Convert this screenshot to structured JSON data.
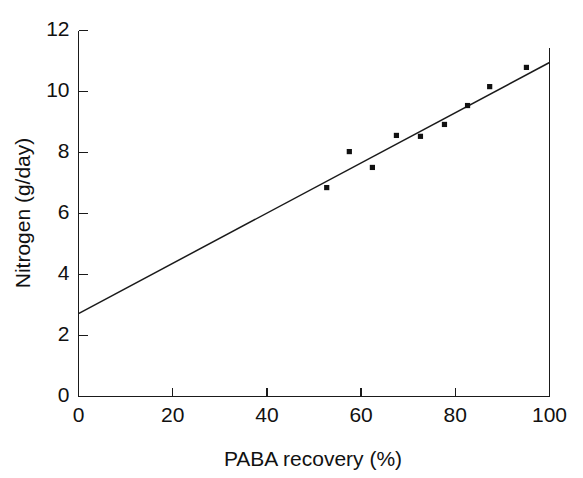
{
  "chart_data": {
    "type": "scatter",
    "title": "",
    "subtitle": "",
    "xlabel": "PABA recovery (%)",
    "ylabel": "Nitrogen (g/day)",
    "xlim": [
      0,
      100
    ],
    "ylim": [
      0,
      12
    ],
    "xticks": [
      0,
      20,
      40,
      60,
      80,
      100
    ],
    "yticks": [
      0,
      2,
      4,
      6,
      8,
      10,
      12
    ],
    "xtick_labels": [
      "0",
      "20",
      "40",
      "60",
      "80",
      "100"
    ],
    "ytick_labels": [
      "0",
      "2",
      "4",
      "6",
      "8",
      "10",
      "12"
    ],
    "grid": false,
    "legend": false,
    "legend_position": "none",
    "marker": "square",
    "marker_color": "#111111",
    "line_color": "#1a1a1a",
    "axis_color": "#1a1a1a",
    "background_color": "#ffffff",
    "points": [
      {
        "x": 52.7,
        "y": 6.85
      },
      {
        "x": 57.5,
        "y": 8.03
      },
      {
        "x": 62.4,
        "y": 7.51
      },
      {
        "x": 67.5,
        "y": 8.56
      },
      {
        "x": 72.6,
        "y": 8.53
      },
      {
        "x": 77.7,
        "y": 8.92
      },
      {
        "x": 82.6,
        "y": 9.54
      },
      {
        "x": 87.3,
        "y": 10.16
      },
      {
        "x": 95.1,
        "y": 10.79
      }
    ],
    "series": [
      {
        "name": "observations",
        "type": "scatter",
        "x": [
          52.7,
          57.5,
          62.4,
          67.5,
          72.6,
          77.7,
          82.6,
          87.3,
          95.1
        ],
        "values": [
          6.85,
          8.03,
          7.51,
          8.56,
          8.53,
          8.92,
          9.54,
          10.16,
          10.79
        ]
      },
      {
        "name": "regression-line",
        "type": "line",
        "x": [
          0,
          100
        ],
        "values": [
          2.72,
          10.95
        ],
        "intercept": 2.72,
        "slope": 0.0823
      }
    ],
    "fit_line": {
      "x_start": 0,
      "y_start": 2.72,
      "x_end": 100,
      "y_end": 10.95
    }
  },
  "figure": {
    "name": "paba-nitrogen-scatter"
  }
}
